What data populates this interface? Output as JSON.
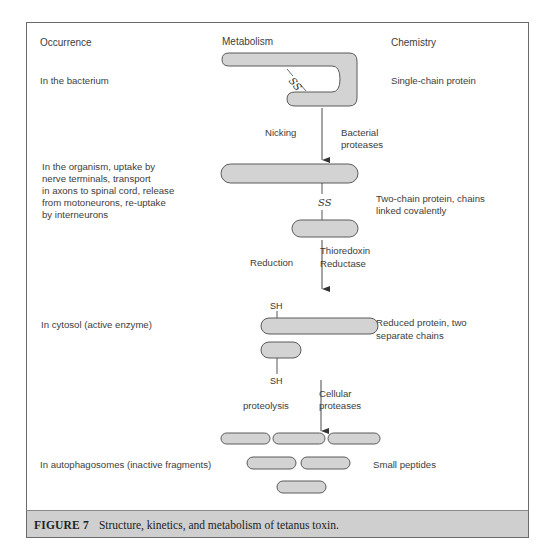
{
  "figure": {
    "caption_label": "FIGURE 7",
    "caption_text": "Structure, kinetics, and metabolism of tetanus toxin."
  },
  "columns": {
    "occurrence": "Occurrence",
    "metabolism": "Metabolism",
    "chemistry": "Chemistry"
  },
  "stages": [
    {
      "occurrence": "In the bacterium",
      "chemistry": "Single-chain protein"
    },
    {
      "occurrence_lines": [
        "In the organism, uptake by",
        "nerve terminals, transport",
        "in axons to spinal cord, release",
        "from motoneurons, re-uptake",
        "by interneurons"
      ],
      "chemistry_lines": [
        "Two-chain protein, chains",
        "linked covalently"
      ]
    },
    {
      "occurrence": "In cytosol (active enzyme)",
      "chemistry_lines": [
        "Reduced protein, two",
        "separate chains"
      ]
    },
    {
      "occurrence": "In autophagosomes (inactive fragments)",
      "chemistry": "Small peptides"
    }
  ],
  "transitions": [
    {
      "process": "Nicking",
      "agent_lines": [
        "Bacterial",
        "proteases"
      ]
    },
    {
      "process": "Reduction",
      "agent_lines": [
        "Thioredoxin",
        "Reductase"
      ]
    },
    {
      "process": "proteolysis",
      "agent_lines": [
        "Cellular",
        "proteases"
      ]
    }
  ],
  "labels": {
    "disulfide": "SS",
    "thiol": "SH"
  },
  "colors": {
    "shape_fill": "#d3d3d3",
    "shape_stroke": "#5a5a5a",
    "caption_band": "#cfcfcf",
    "text": "#3d3d3d"
  }
}
